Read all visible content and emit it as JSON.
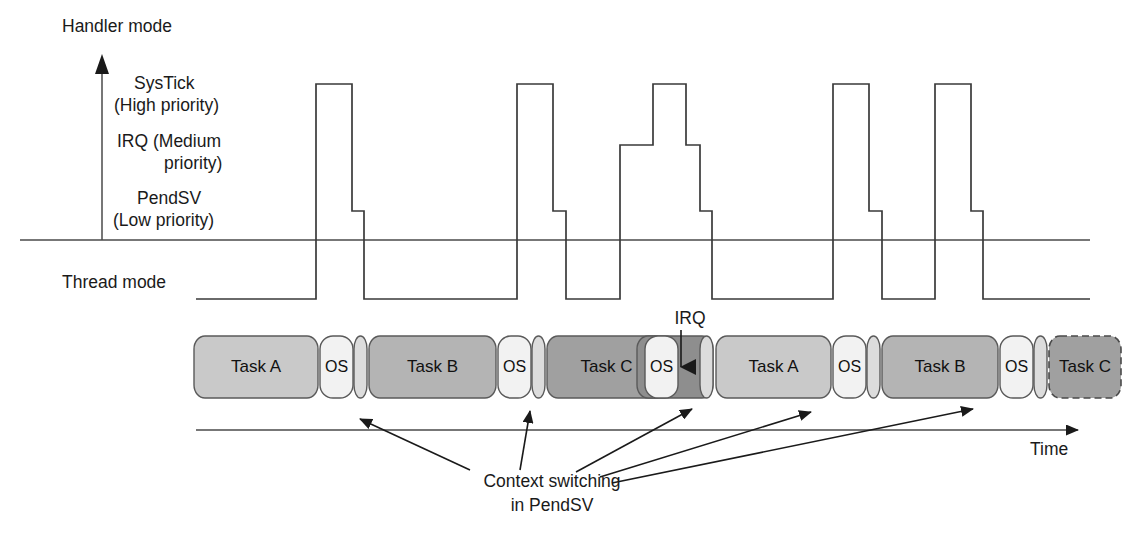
{
  "figure": {
    "axis": {
      "handler_mode_label": "Handler mode",
      "thread_mode_label": "Thread mode",
      "time_label": "Time",
      "priority_levels": [
        {
          "id": "systick",
          "label_line1": "SysTick",
          "label_line2": "(High priority)",
          "y": 84
        },
        {
          "id": "irq",
          "label_line1": "IRQ (Medium",
          "label_line2": "priority)",
          "y": 145
        },
        {
          "id": "pendsv",
          "label_line1": "PendSV",
          "label_line2": "(Low priority)",
          "y": 211
        }
      ],
      "mode_divider_y": 240,
      "thread_level_y": 299,
      "vertical_axis_x": 102,
      "vertical_axis_top_y": 58,
      "timeline_y": 430,
      "timeline_x_start": 196,
      "timeline_x_end": 1090
    },
    "irq_marker": {
      "label": "IRQ",
      "label_x": 690,
      "label_y": 324,
      "arrow_x": 681,
      "arrow_top_y": 330,
      "arrow_tip_y": 381
    },
    "annotation": {
      "line1": "Context switching",
      "line2": "in PendSV",
      "line1_x": 552,
      "line1_y": 487,
      "line2_x": 552,
      "line2_y": 511,
      "arrow_targets": [
        {
          "from_x": 470,
          "from_y": 470,
          "to_x": 360,
          "to_y": 419
        },
        {
          "from_x": 520,
          "from_y": 470,
          "to_x": 530,
          "to_y": 411
        },
        {
          "from_x": 576,
          "from_y": 472,
          "to_x": 692,
          "to_y": 409
        },
        {
          "from_x": 600,
          "from_y": 477,
          "to_x": 811,
          "to_y": 412
        },
        {
          "from_x": 612,
          "from_y": 483,
          "to_x": 973,
          "to_y": 409
        }
      ]
    },
    "waveform": {
      "stroke_color": "#3a3a3a",
      "pulses": [
        {
          "id": "pulse-1",
          "type": "systick",
          "rise_x": 316,
          "high_end_x": 352,
          "pendsv_end_x": 364,
          "fall_x": 364
        },
        {
          "id": "pulse-2",
          "type": "systick",
          "rise_x": 517,
          "high_end_x": 553,
          "pendsv_end_x": 566,
          "fall_x": 566
        },
        {
          "id": "pulse-3",
          "type": "irq-nested",
          "rise_x": 620,
          "irq_up_x": 653,
          "systick_end_x": 686,
          "irq_end_x": 700,
          "pendsv_end_x": 712,
          "fall_x": 712
        },
        {
          "id": "pulse-4",
          "type": "systick",
          "rise_x": 833,
          "high_end_x": 869,
          "pendsv_end_x": 882,
          "fall_x": 882
        },
        {
          "id": "pulse-5",
          "type": "systick",
          "rise_x": 935,
          "high_end_x": 971,
          "pendsv_end_x": 983,
          "fall_x": 983
        }
      ]
    },
    "task_track": {
      "y": 336,
      "height": 62,
      "colors": {
        "task_a": "#c9c9c9",
        "task_b": "#b4b4b4",
        "task_c": "#a0a0a0",
        "os": "#f2f2f2",
        "separator": "#dcdcdc",
        "irq_block": "#8e8e8e"
      },
      "blocks": [
        {
          "name": "task-a-1",
          "label": "Task A",
          "x": 194,
          "w": 124,
          "fill": "task_a",
          "shape": "rounded",
          "dashed": false
        },
        {
          "name": "os-1",
          "label": "OS",
          "x": 320,
          "w": 33,
          "fill": "os",
          "shape": "pill",
          "dashed": false
        },
        {
          "name": "switch-sep-1",
          "label": "",
          "x": 354,
          "w": 13,
          "fill": "separator",
          "shape": "pill",
          "dashed": false
        },
        {
          "name": "task-b-1",
          "label": "Task B",
          "x": 369,
          "w": 127,
          "fill": "task_b",
          "shape": "rounded",
          "dashed": false
        },
        {
          "name": "os-2",
          "label": "OS",
          "x": 498,
          "w": 33,
          "fill": "os",
          "shape": "pill",
          "dashed": false
        },
        {
          "name": "switch-sep-2",
          "label": "",
          "x": 532,
          "w": 13,
          "fill": "separator",
          "shape": "pill",
          "dashed": false
        },
        {
          "name": "task-c-1",
          "label": "Task C",
          "x": 547,
          "w": 119,
          "fill": "task_c",
          "shape": "rounded",
          "dashed": false
        },
        {
          "name": "irq-region",
          "label": "",
          "x": 637,
          "w": 76,
          "fill": "irq_block",
          "shape": "rounded",
          "dashed": false
        },
        {
          "name": "os-3",
          "label": "OS",
          "x": 645,
          "w": 33,
          "fill": "os",
          "shape": "pill",
          "dashed": false
        },
        {
          "name": "switch-sep-3",
          "label": "",
          "x": 700,
          "w": 13,
          "fill": "separator",
          "shape": "pill",
          "dashed": false
        },
        {
          "name": "task-a-2",
          "label": "Task A",
          "x": 716,
          "w": 115,
          "fill": "task_a",
          "shape": "rounded",
          "dashed": false
        },
        {
          "name": "os-4",
          "label": "OS",
          "x": 833,
          "w": 33,
          "fill": "os",
          "shape": "pill",
          "dashed": false
        },
        {
          "name": "switch-sep-4",
          "label": "",
          "x": 867,
          "w": 13,
          "fill": "separator",
          "shape": "pill",
          "dashed": false
        },
        {
          "name": "task-b-2",
          "label": "Task B",
          "x": 882,
          "w": 116,
          "fill": "task_b",
          "shape": "rounded",
          "dashed": false
        },
        {
          "name": "os-5",
          "label": "OS",
          "x": 1000,
          "w": 33,
          "fill": "os",
          "shape": "pill",
          "dashed": false
        },
        {
          "name": "switch-sep-5",
          "label": "",
          "x": 1034,
          "w": 13,
          "fill": "separator",
          "shape": "pill",
          "dashed": false
        },
        {
          "name": "task-c-2",
          "label": "Task C",
          "x": 1049,
          "w": 72,
          "fill": "task_c",
          "shape": "rounded",
          "dashed": true
        }
      ]
    }
  }
}
